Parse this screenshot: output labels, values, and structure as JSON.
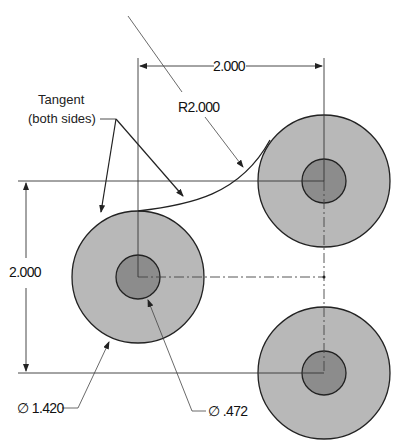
{
  "drawing": {
    "colors": {
      "outer_fill": "#b8b8b8",
      "inner_fill": "#8c8c8c",
      "line": "#222222",
      "thin_line": "#444444"
    },
    "annotations": {
      "tangent_line1": "Tangent",
      "tangent_line2": "(both sides)",
      "radius": "R2.000",
      "horizontal_dim": "2.000",
      "vertical_dim": "2.000",
      "outer_diameter": "∅ 1.420",
      "inner_diameter": "∅ .472"
    },
    "circles": [
      {
        "id": "left",
        "cx": 138,
        "cy": 277,
        "outer_r": 66,
        "inner_r": 22
      },
      {
        "id": "top-right",
        "cx": 324,
        "cy": 181,
        "outer_r": 66,
        "inner_r": 22
      },
      {
        "id": "bottom-right",
        "cx": 324,
        "cy": 373,
        "outer_r": 66,
        "inner_r": 22
      }
    ]
  }
}
